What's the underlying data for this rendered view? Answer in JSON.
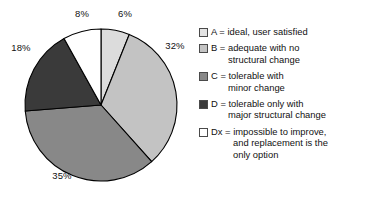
{
  "chart_data": {
    "type": "pie",
    "title": "",
    "subtitle": "",
    "xlabel": "",
    "ylabel": "",
    "grid": false,
    "legend_position": "right",
    "start_angle_deg": 0,
    "direction": "clockwise",
    "categories": [
      "A",
      "B",
      "C",
      "D",
      "Dx"
    ],
    "values": [
      6,
      32,
      35,
      18,
      8
    ],
    "value_unit": "%",
    "data_labels": [
      "6%",
      "32%",
      "35%",
      "18%",
      "8%"
    ],
    "slice_colors": [
      "#dcdcdc",
      "#c3c3c3",
      "#888888",
      "#3a3a3a",
      "#ffffff"
    ],
    "slice_edge_color": "#000000",
    "series": [
      {
        "name": "Condition rating",
        "values": [
          6,
          32,
          35,
          18,
          8
        ]
      }
    ],
    "legend_entries": [
      {
        "key": "A",
        "swatch": "#e3e3e3",
        "lines": [
          "A = ideal, user satisfied"
        ]
      },
      {
        "key": "B",
        "swatch": "#c3c3c3",
        "lines": [
          "B = adequate with no",
          "structural change"
        ]
      },
      {
        "key": "C",
        "swatch": "#888888",
        "lines": [
          "C = tolerable with",
          "minor change"
        ]
      },
      {
        "key": "D",
        "swatch": "#3a3a3a",
        "lines": [
          "D = tolerable only with",
          "major structural change"
        ]
      },
      {
        "key": "Dx",
        "swatch": "#ffffff",
        "lines": [
          "Dx = impossible to improve,",
          "and replacement is the",
          "only option"
        ]
      }
    ]
  },
  "pie": {
    "labels": {
      "a": "6%",
      "b": "32%",
      "c": "35%",
      "d": "18%",
      "dx": "8%"
    }
  },
  "legend": {
    "items": [
      {
        "line1": "A = ideal, user satisfied",
        "line2": "",
        "line3": ""
      },
      {
        "line1": "B = adequate with no",
        "line2": "structural change",
        "line3": ""
      },
      {
        "line1": "C = tolerable with",
        "line2": "minor change",
        "line3": ""
      },
      {
        "line1": "D = tolerable only with",
        "line2": "major structural change",
        "line3": ""
      },
      {
        "line1": "Dx = impossible to improve,",
        "line2": "and replacement is the",
        "line3": "only option"
      }
    ]
  }
}
